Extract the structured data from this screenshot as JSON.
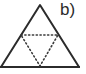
{
  "figure": {
    "panel_label": "b)",
    "background_color": "#ffffff",
    "stroke_color": "#2b2b2b",
    "dotted_stroke_color": "#3a3a3a",
    "outer_triangle": {
      "name": "outer-triangle",
      "style": "solid",
      "stroke_width": 2,
      "points": "40,5 79,67 1,67"
    },
    "inner_triangle": {
      "name": "inner-inverted-triangle",
      "style": "dotted",
      "stroke_width": 1.6,
      "points": "21,35 58,35 40,66"
    },
    "base_line": {
      "name": "base-line",
      "style": "solid",
      "stroke_width": 2,
      "x1": 0,
      "y1": 67,
      "x2": 80,
      "y2": 67
    }
  }
}
